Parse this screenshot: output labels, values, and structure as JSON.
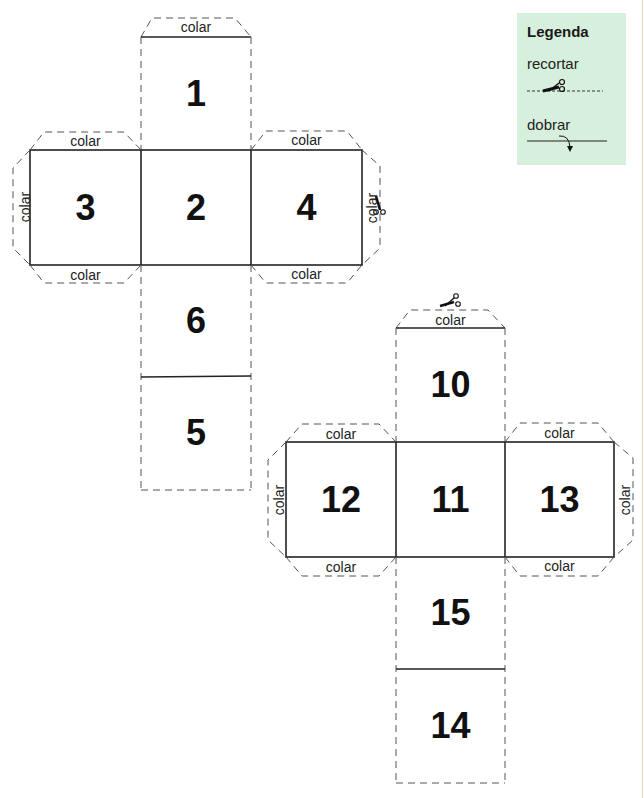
{
  "legend": {
    "title": "Legenda",
    "cut_label": "recortar",
    "fold_label": "dobrar",
    "background": "#d7efdd"
  },
  "tab_label": "colar",
  "nets": [
    {
      "name": "net-1",
      "faces": [
        "1",
        "3",
        "2",
        "4",
        "6",
        "5"
      ],
      "tab_labels": {
        "top_1": "colar",
        "top_3": "colar",
        "left_3": "colar",
        "bottom_3": "colar",
        "top_4": "colar",
        "right_4": "colar",
        "bottom_4": "colar"
      }
    },
    {
      "name": "net-2",
      "faces": [
        "10",
        "12",
        "11",
        "13",
        "15",
        "14"
      ],
      "tab_labels": {
        "top_10": "colar",
        "top_12": "colar",
        "left_12": "colar",
        "bottom_12": "colar",
        "top_13": "colar",
        "right_13": "colar",
        "bottom_13": "colar"
      }
    }
  ],
  "icons": {
    "scissors": "scissors-icon",
    "fold_arrow": "fold-arrow-icon"
  }
}
